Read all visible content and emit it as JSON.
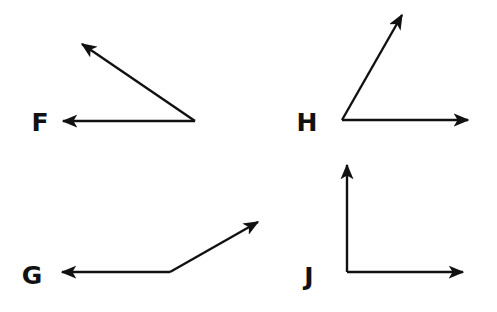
{
  "figure": {
    "ink_color": "#111111",
    "background_color": "#ffffff"
  },
  "angles": [
    {
      "label": "F",
      "label_pos": [
        40,
        131
      ],
      "vertex": [
        195,
        121
      ],
      "rays": [
        [
          63,
          121
        ],
        [
          82,
          44
        ]
      ],
      "type": "acute"
    },
    {
      "label": "H",
      "label_pos": [
        307,
        131
      ],
      "vertex": [
        342,
        120
      ],
      "rays": [
        [
          468,
          120
        ],
        [
          402,
          15
        ]
      ],
      "type": "acute"
    },
    {
      "label": "G",
      "label_pos": [
        32,
        284
      ],
      "vertex": [
        170,
        272
      ],
      "rays": [
        [
          62,
          272
        ],
        [
          258,
          222
        ]
      ],
      "type": "obtuse"
    },
    {
      "label": "J",
      "label_pos": [
        309,
        285
      ],
      "vertex": [
        347,
        272
      ],
      "rays": [
        [
          347,
          165
        ],
        [
          463,
          272
        ]
      ],
      "type": "right"
    }
  ]
}
